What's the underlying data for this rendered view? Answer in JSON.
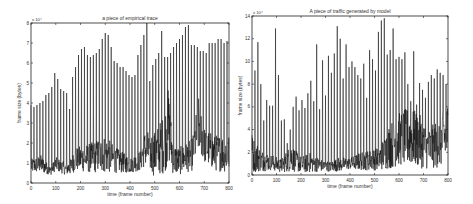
{
  "chart_data": [
    {
      "type": "line",
      "title": "a piece of empirical trace",
      "xlabel": "time (frame number)",
      "ylabel": "frame size (bytes)",
      "y_multiplier": "x 10^4",
      "xlim": [
        0,
        800
      ],
      "ylim": [
        0,
        8
      ],
      "xticks": [
        0,
        100,
        200,
        300,
        400,
        500,
        600,
        700,
        800
      ],
      "yticks": [
        0,
        1,
        2,
        3,
        4,
        5,
        6,
        7,
        8
      ],
      "grid": false,
      "box": {
        "x0": 31,
        "y0": 23,
        "x1": 229,
        "y1": 183
      },
      "peak_period_frames": 12,
      "peak_frames": [
        0,
        12,
        24,
        36,
        48,
        60,
        72,
        84,
        96,
        108,
        120,
        132,
        144,
        156,
        168,
        180,
        192,
        204,
        216,
        228,
        240,
        252,
        264,
        276,
        288,
        300,
        312,
        324,
        336,
        348,
        360,
        372,
        384,
        396,
        408,
        420,
        432,
        444,
        456,
        468,
        480,
        492,
        504,
        516,
        528,
        540,
        552,
        564,
        576,
        588,
        600,
        612,
        624,
        636,
        648,
        660,
        672,
        684,
        696,
        708,
        720,
        732,
        744,
        756,
        768,
        780,
        792
      ],
      "peak_values": [
        3.9,
        3.8,
        3.9,
        4.0,
        4.1,
        4.4,
        4.5,
        4.8,
        5.5,
        5.2,
        4.7,
        4.6,
        4.5,
        3.7,
        5.3,
        5.8,
        6.4,
        6.7,
        6.8,
        6.4,
        6.3,
        6.4,
        6.5,
        6.7,
        7.2,
        7.5,
        7.4,
        6.8,
        6.1,
        6.0,
        5.8,
        5.8,
        5.6,
        5.4,
        5.3,
        5.4,
        6.4,
        6.9,
        7.4,
        8.0,
        5.1,
        5.9,
        6.2,
        6.5,
        7.6,
        6.3,
        6.3,
        6.5,
        6.8,
        7.0,
        7.2,
        7.4,
        7.8,
        7.9,
        6.9,
        6.9,
        6.8,
        6.6,
        6.6,
        6.5,
        7.0,
        7.0,
        7.0,
        7.2,
        7.2,
        7.0,
        7.1
      ],
      "baseline_envelope": {
        "x": [
          0,
          40,
          80,
          100,
          140,
          160,
          180,
          240,
          300,
          340,
          400,
          440,
          460,
          500,
          540,
          555,
          575,
          600,
          650,
          680,
          700,
          740,
          800
        ],
        "low": [
          0.5,
          0.5,
          0.4,
          0.6,
          0.4,
          0.4,
          0.6,
          0.5,
          0.5,
          0.5,
          0.5,
          0.6,
          0.8,
          0.3,
          0.5,
          1.0,
          0.4,
          0.4,
          0.6,
          1.5,
          1.0,
          0.6,
          0.5
        ],
        "high": [
          1.2,
          1.4,
          0.8,
          1.3,
          1.0,
          1.2,
          1.8,
          2.0,
          2.4,
          1.8,
          1.3,
          1.6,
          2.6,
          2.6,
          3.5,
          4.8,
          2.0,
          1.8,
          2.2,
          4.5,
          2.8,
          2.4,
          2.5
        ]
      }
    },
    {
      "type": "line",
      "title": "A piece of traffic generated by model",
      "xlabel": "time (frame number)",
      "ylabel": "frame size (bytes)",
      "y_multiplier": "x 10^4",
      "xlim": [
        0,
        800
      ],
      "ylim": [
        0,
        14
      ],
      "xticks": [
        0,
        100,
        200,
        300,
        400,
        500,
        600,
        700,
        800
      ],
      "yticks": [
        0,
        2,
        4,
        6,
        8,
        10,
        12,
        14
      ],
      "grid": false,
      "box": {
        "x0": 252,
        "y0": 16,
        "x1": 448,
        "y1": 175
      },
      "peak_period_frames": 12,
      "peak_frames": [
        0,
        12,
        24,
        36,
        48,
        60,
        72,
        84,
        96,
        108,
        120,
        132,
        144,
        156,
        168,
        180,
        192,
        204,
        216,
        228,
        240,
        252,
        264,
        276,
        288,
        300,
        312,
        324,
        336,
        348,
        360,
        372,
        384,
        396,
        408,
        420,
        432,
        444,
        456,
        468,
        480,
        492,
        504,
        516,
        528,
        540,
        552,
        564,
        576,
        588,
        600,
        612,
        624,
        636,
        648,
        660,
        672,
        684,
        696,
        708,
        720,
        732,
        744,
        756,
        768,
        780,
        792
      ],
      "peak_values": [
        3.5,
        9.2,
        11.7,
        8.0,
        4.8,
        6.6,
        6.1,
        6.1,
        12.9,
        8.8,
        4.8,
        4.9,
        2.8,
        4.0,
        6.0,
        6.9,
        5.7,
        6.6,
        5.9,
        7.2,
        8.3,
        6.5,
        11.5,
        5.8,
        10.1,
        7.0,
        10.5,
        9.0,
        10.7,
        13.1,
        12.0,
        8.5,
        11.5,
        9.5,
        10.0,
        9.5,
        8.8,
        8.5,
        9.8,
        6.8,
        11.0,
        10.2,
        9.2,
        12.6,
        13.6,
        13.8,
        10.6,
        11.0,
        12.9,
        10.2,
        10.4,
        10.2,
        10.8,
        8.0,
        6.5,
        10.9,
        6.2,
        8.1,
        7.5,
        6.8,
        8.2,
        8.8,
        8.5,
        9.3,
        9.0,
        8.8,
        8.0
      ],
      "baseline_envelope": {
        "x": [
          0,
          40,
          80,
          120,
          160,
          200,
          240,
          280,
          320,
          360,
          400,
          440,
          480,
          520,
          560,
          600,
          640,
          680,
          720,
          760,
          800
        ],
        "low": [
          0.2,
          0.3,
          0.4,
          0.2,
          0.3,
          0.2,
          0.2,
          0.3,
          0.3,
          0.3,
          0.5,
          0.4,
          0.4,
          0.4,
          0.5,
          0.8,
          0.7,
          0.6,
          0.5,
          0.6,
          0.8
        ],
        "high": [
          3.5,
          2.2,
          1.8,
          1.4,
          2.8,
          1.6,
          2.0,
          1.4,
          1.2,
          1.6,
          1.5,
          2.0,
          2.2,
          2.5,
          4.5,
          5.5,
          6.0,
          5.5,
          4.0,
          5.0,
          6.5
        ]
      }
    }
  ]
}
